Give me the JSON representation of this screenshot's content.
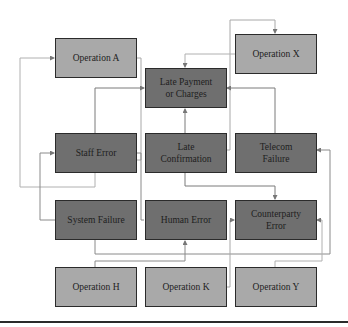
{
  "diagram": {
    "colors": {
      "operation_fill": "#a9a9a9",
      "cause_fill": "#6f6f6f",
      "border": "#2b2b2b",
      "connector": "#9a9a9a",
      "connector_dark": "#6a6a6a"
    },
    "nodes": {
      "operation_a": {
        "label": "Operation A",
        "type": "operation"
      },
      "operation_x": {
        "label": "Operation X",
        "type": "operation"
      },
      "late_payment": {
        "label": "Late Payment or Charges",
        "line1": "Late Payment",
        "line2": "or Charges",
        "type": "outcome"
      },
      "staff_error": {
        "label": "Staff Error",
        "type": "cause"
      },
      "late_confirmation": {
        "label": "Late Confirmation",
        "line1": "Late",
        "line2": "Confirmation",
        "type": "cause"
      },
      "telecom_failure": {
        "label": "Telecom Failure",
        "line1": "Telecom",
        "line2": "Failure",
        "type": "cause"
      },
      "system_failure": {
        "label": "System Failure",
        "type": "cause"
      },
      "human_error": {
        "label": "Human Error",
        "type": "cause"
      },
      "counterparty_error": {
        "label": "Counterparty Error",
        "line1": "Counterparty",
        "line2": "Error",
        "type": "cause"
      },
      "operation_h": {
        "label": "Operation H",
        "type": "operation"
      },
      "operation_k": {
        "label": "Operation K",
        "type": "operation"
      },
      "operation_y": {
        "label": "Operation Y",
        "type": "operation"
      }
    },
    "edges": [
      {
        "from": "Operation A",
        "to": "Late Payment or Charges"
      },
      {
        "from": "Operation X",
        "to": "Late Payment or Charges"
      },
      {
        "from": "Late Confirmation",
        "to": "Operation X"
      },
      {
        "from": "Staff Error",
        "to": "Late Payment or Charges"
      },
      {
        "from": "Late Confirmation",
        "to": "Late Payment or Charges"
      },
      {
        "from": "Telecom Failure",
        "to": "Late Payment or Charges"
      },
      {
        "from": "Staff Error",
        "to": "Operation A"
      },
      {
        "from": "Operation A",
        "to": "Staff Error"
      },
      {
        "from": "System Failure",
        "to": "Staff Error"
      },
      {
        "from": "Late Confirmation",
        "to": "Counterparty Error"
      },
      {
        "from": "Human Error",
        "to": "Late Confirmation"
      },
      {
        "from": "System Failure",
        "to": "Telecom Failure"
      },
      {
        "from": "Operation H",
        "to": "Human Error"
      },
      {
        "from": "Operation K",
        "to": "Counterparty Error"
      },
      {
        "from": "Operation Y",
        "to": "Counterparty Error"
      }
    ]
  }
}
